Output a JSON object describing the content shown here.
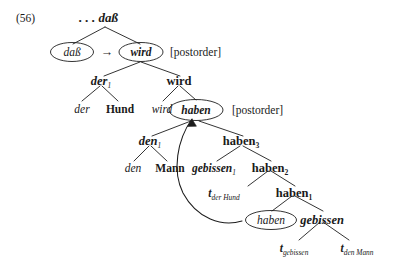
{
  "figure": {
    "example_number": "(56)",
    "root_label": ". . . daß",
    "annotations": [
      {
        "id": "postorder-top",
        "text": "[postorder]"
      },
      {
        "id": "postorder-mid",
        "text": "[postorder]"
      }
    ],
    "operator_arrow": "→",
    "circled_nodes": [
      {
        "id": "circ-dass",
        "label": "daß",
        "style": "italic"
      },
      {
        "id": "circ-wird",
        "label": "wird",
        "style": "bold-italic"
      },
      {
        "id": "circ-haben-mid",
        "label": "haben",
        "style": "bold-italic"
      },
      {
        "id": "circ-haben-low",
        "label": "haben",
        "style": "italic"
      }
    ],
    "tree_nodes": [
      {
        "id": "n-root",
        "label": ". . . daß",
        "sub": "",
        "style": "bold-italic",
        "level": 0
      },
      {
        "id": "n-der1",
        "label": "der",
        "sub": "1",
        "style": "bold-italic",
        "level": 2
      },
      {
        "id": "n-wird2",
        "label": "wird",
        "sub": "",
        "style": "bold",
        "level": 2
      },
      {
        "id": "n-der-leaf",
        "label": "der",
        "sub": "",
        "style": "italic",
        "level": 3
      },
      {
        "id": "n-hund",
        "label": "Hund",
        "sub": "",
        "style": "bold",
        "level": 3
      },
      {
        "id": "n-wird-leaf",
        "label": "wird",
        "sub": "",
        "style": "italic",
        "level": 3
      },
      {
        "id": "n-den1",
        "label": "den",
        "sub": "1",
        "style": "bold-italic",
        "level": 4
      },
      {
        "id": "n-haben3",
        "label": "haben",
        "sub": "3",
        "style": "bold",
        "level": 4
      },
      {
        "id": "n-den-leaf",
        "label": "den",
        "sub": "",
        "style": "italic",
        "level": 5
      },
      {
        "id": "n-mann",
        "label": "Mann",
        "sub": "",
        "style": "bold",
        "level": 5
      },
      {
        "id": "n-gebissen1",
        "label": "gebissen",
        "sub": "1",
        "style": "bold-italic",
        "level": 5
      },
      {
        "id": "n-haben2",
        "label": "haben",
        "sub": "2",
        "style": "bold",
        "level": 5
      },
      {
        "id": "n-trace-derhund",
        "label": "t",
        "sub": "der Hund",
        "style": "trace",
        "level": 6
      },
      {
        "id": "n-haben1",
        "label": "haben",
        "sub": "1",
        "style": "bold",
        "level": 6
      },
      {
        "id": "n-gebissen",
        "label": "gebissen",
        "sub": "",
        "style": "bold-italic",
        "level": 7
      },
      {
        "id": "n-trace-gebissen",
        "label": "t",
        "sub": "gebissen",
        "style": "trace",
        "level": 8
      },
      {
        "id": "n-trace-denmann",
        "label": "t",
        "sub": "den Mann",
        "style": "trace",
        "level": 8
      }
    ],
    "text": {
      "exnum": "(56)",
      "root": ". . . daß",
      "dass": "daß",
      "wird_circ": "wird",
      "arrow": "→",
      "postorder1": "[postorder]",
      "der1": "der",
      "der1_sub": "1",
      "wird2": "wird",
      "der_leaf": "der",
      "hund": "Hund",
      "wird_leaf": "wird",
      "haben_mid": "haben",
      "postorder2": "[postorder]",
      "den1": "den",
      "den1_sub": "1",
      "haben3": "haben",
      "haben3_sub": "3",
      "den_leaf": "den",
      "mann": "Mann",
      "gebissen1": "gebissen",
      "gebissen1_sub": "1",
      "haben2": "haben",
      "haben2_sub": "2",
      "trace_t": "t",
      "trace_derhund_sub": "der Hund",
      "haben1": "haben",
      "haben1_sub": "1",
      "haben_low": "haben",
      "gebissen": "gebissen",
      "trace_gebissen_sub": "gebissen",
      "trace_denmann_sub": "den Mann"
    },
    "colors": {
      "ink": "#1a1a1a",
      "line": "#1d1d1d",
      "background": "#ffffff"
    }
  }
}
